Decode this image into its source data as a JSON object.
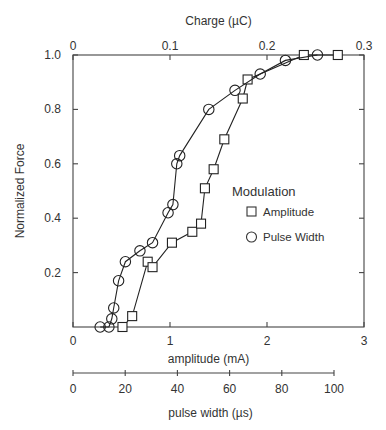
{
  "chart_data": {
    "type": "line",
    "title": "",
    "ylabel": "Normalized Force",
    "xlabel": "amplitude    (mA)",
    "xlim": [
      0,
      3
    ],
    "ylim": [
      0,
      1.0
    ],
    "x_ticks": [
      "0",
      "1",
      "2",
      "3"
    ],
    "y_ticks": [
      "0.2",
      "0.4",
      "0.6",
      "0.8",
      "1.0"
    ],
    "top_axis": {
      "label": "Charge (µC)",
      "range": [
        0,
        0.3
      ],
      "ticks": [
        "0",
        "0.1",
        "0.2",
        "0.3"
      ]
    },
    "secondary_bottom_axis": {
      "label": "pulse width    (µs)",
      "range": [
        0,
        100
      ],
      "ticks": [
        "0",
        "20",
        "40",
        "60",
        "80",
        "100"
      ]
    },
    "legend": {
      "title": "Modulation",
      "position": "right-middle",
      "entries": [
        {
          "label": "Amplitude",
          "marker": "square"
        },
        {
          "label": "Pulse Width",
          "marker": "circle"
        }
      ]
    },
    "grid": false,
    "series": [
      {
        "name": "Amplitude",
        "marker": "square",
        "x": [
          0.51,
          0.61,
          0.77,
          0.82,
          1.02,
          1.23,
          1.32,
          1.36,
          1.45,
          1.56,
          1.75,
          1.8,
          2.38,
          2.73
        ],
        "y": [
          0.0,
          0.04,
          0.24,
          0.22,
          0.31,
          0.35,
          0.38,
          0.51,
          0.58,
          0.69,
          0.84,
          0.91,
          1.0,
          1.0
        ]
      },
      {
        "name": "Pulse Width",
        "marker": "circle",
        "x": [
          0.28,
          0.37,
          0.4,
          0.42,
          0.47,
          0.54,
          0.69,
          0.82,
          0.98,
          1.03,
          1.07,
          1.1,
          1.4,
          1.67,
          1.93,
          2.19,
          2.52
        ],
        "y": [
          0.0,
          0.0,
          0.03,
          0.07,
          0.17,
          0.24,
          0.28,
          0.31,
          0.42,
          0.45,
          0.6,
          0.63,
          0.8,
          0.87,
          0.93,
          0.98,
          1.0
        ]
      }
    ]
  }
}
